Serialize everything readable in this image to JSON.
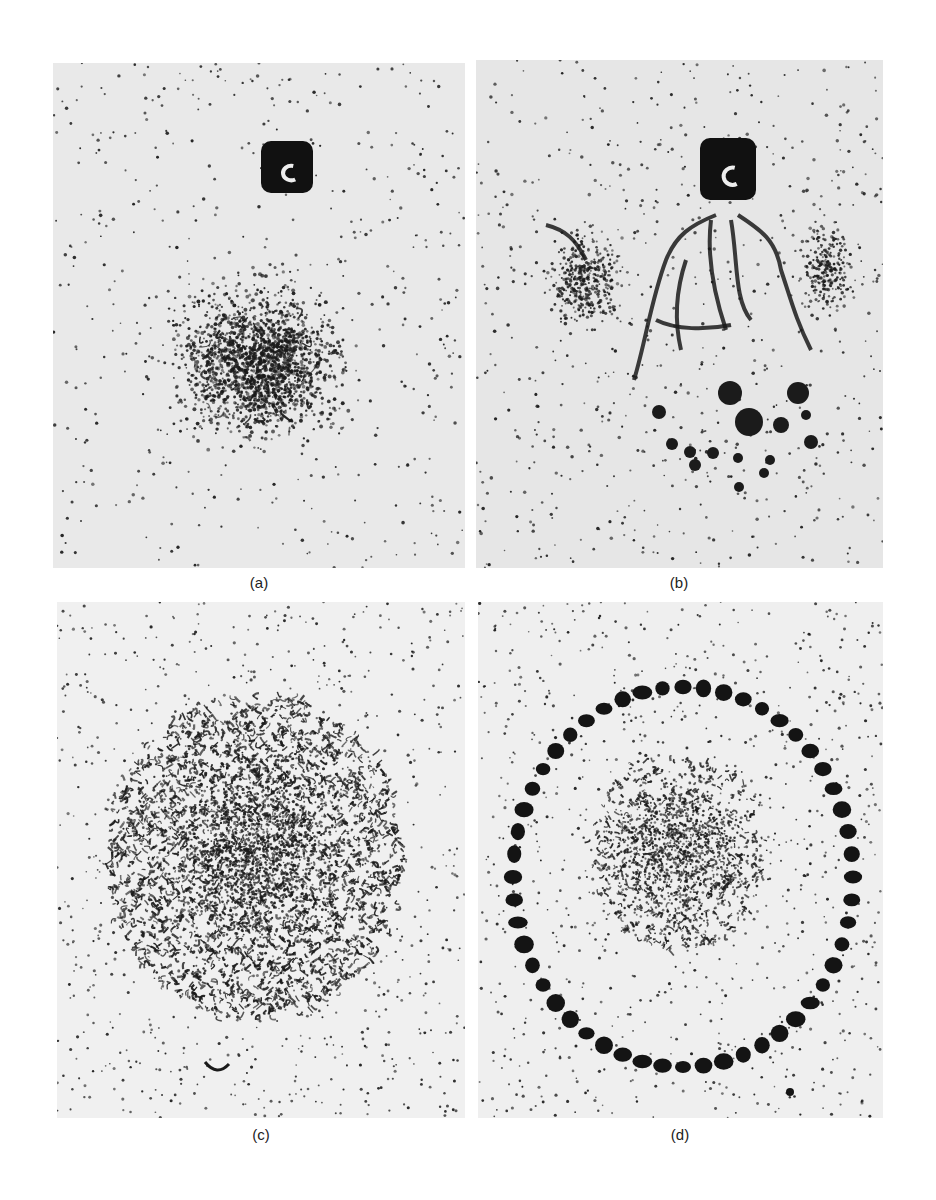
{
  "figure": {
    "panels": [
      {
        "id": "a",
        "label": "(a)",
        "description": "Scattered dark decoration pits around a central disturbed region below a dark rectangular indentation mark"
      },
      {
        "id": "b",
        "label": "(b)",
        "description": "Dark rectangular indentation mark with branching crack/slip features extending downward and large circular pits below"
      },
      {
        "id": "c",
        "label": "(c)",
        "description": "Dense circular region of dark wrinkled decoration surrounded by sparse dots"
      },
      {
        "id": "d",
        "label": "(d)",
        "description": "Ring of large dark pits surrounding a moderately dense central decorated region"
      }
    ]
  },
  "colors": {
    "background": "#ffffff",
    "plate_a": "#e9e9e9",
    "plate_b": "#e6e6e6",
    "plate_c": "#f0f0f0",
    "plate_d": "#efefef",
    "ink": "#1a1a1a"
  }
}
